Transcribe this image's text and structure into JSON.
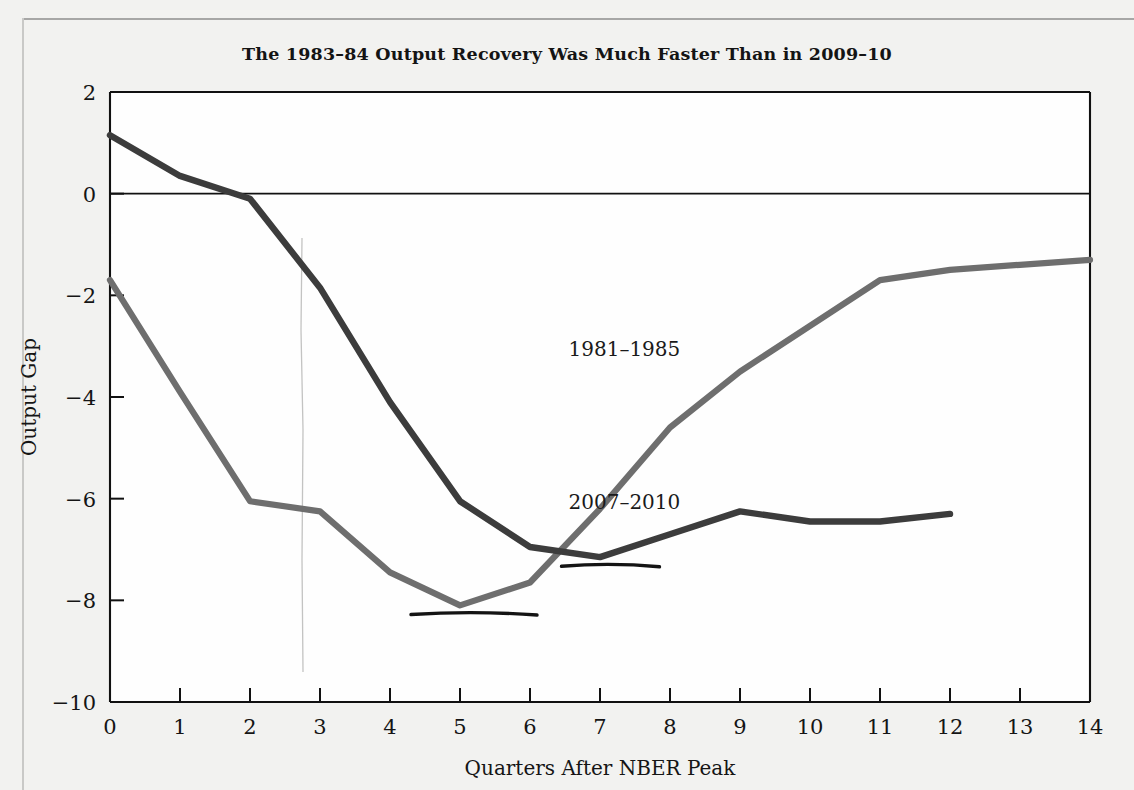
{
  "chart_data": {
    "type": "line",
    "title": "The 1983–84 Output Recovery Was Much Faster Than in 2009–10",
    "xlabel": "Quarters After NBER Peak",
    "ylabel": "Output Gap",
    "x": [
      0,
      1,
      2,
      3,
      4,
      5,
      6,
      7,
      8,
      9,
      10,
      11,
      12,
      13,
      14
    ],
    "xlim": [
      0,
      14
    ],
    "ylim": [
      -10,
      2
    ],
    "xticks": [
      "0",
      "1",
      "2",
      "3",
      "4",
      "5",
      "6",
      "7",
      "8",
      "9",
      "10",
      "11",
      "12",
      "13",
      "14"
    ],
    "yticks": [
      "2",
      "0",
      "-2",
      "-4",
      "-6",
      "-8",
      "-10"
    ],
    "ytick_values": [
      2,
      0,
      -2,
      -4,
      -6,
      -8,
      -10
    ],
    "grid": false,
    "zero_line": true,
    "legend_position": "inline-annotations",
    "series": [
      {
        "name": "1981–1985",
        "color": "#6e6e6e",
        "label_x": 6.55,
        "label_y": -3.2,
        "x": [
          0,
          1,
          2,
          3,
          4,
          5,
          6,
          7,
          8,
          9,
          10,
          11,
          12,
          13,
          14
        ],
        "values": [
          -1.7,
          -3.9,
          -6.05,
          -6.25,
          -7.45,
          -8.1,
          -7.65,
          -6.2,
          -4.6,
          -3.5,
          -2.6,
          -1.7,
          -1.5,
          -1.4,
          -1.3
        ]
      },
      {
        "name": "2007–2010",
        "color": "#3c3c3c",
        "label_x": 6.55,
        "label_y": -6.2,
        "x": [
          0,
          1,
          2,
          3,
          4,
          5,
          6,
          7,
          8,
          9,
          10,
          11,
          12
        ],
        "values": [
          1.15,
          0.35,
          -0.1,
          -1.85,
          -4.1,
          -6.05,
          -6.95,
          -7.15,
          -6.7,
          -6.25,
          -6.45,
          -6.45,
          -6.3
        ]
      }
    ],
    "annotations": [
      {
        "name": "pen-underline-1981-trough",
        "type": "handwritten-underline",
        "x_start": 4.3,
        "x_end": 6.1,
        "y": -8.25
      },
      {
        "name": "pen-underline-2007-trough",
        "type": "handwritten-underline",
        "x_start": 6.45,
        "x_end": 7.85,
        "y": -7.3
      }
    ]
  }
}
